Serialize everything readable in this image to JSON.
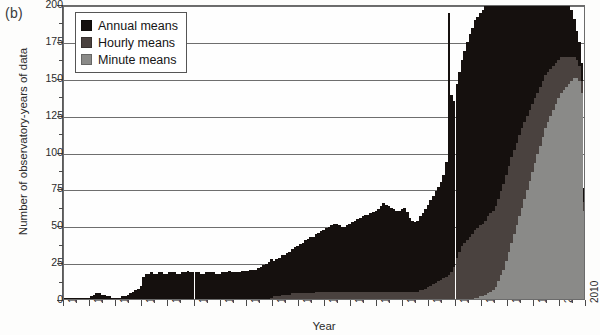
{
  "panel": {
    "label": "(b)"
  },
  "axes": {
    "ylabel": "Number of observatory-years of data",
    "xlabel": "Year",
    "yticks": [
      0,
      25,
      50,
      75,
      100,
      125,
      150,
      175,
      200
    ],
    "xticks": [
      1810,
      1820,
      1830,
      1840,
      1850,
      1860,
      1870,
      1880,
      1890,
      1900,
      1910,
      1920,
      1930,
      1940,
      1950,
      1960,
      1970,
      1980,
      1990,
      2000,
      2010
    ]
  },
  "legend": {
    "items": [
      {
        "label": "Annual means",
        "color": "#15100e"
      },
      {
        "label": "Hourly means",
        "color": "#4a423f"
      },
      {
        "label": "Minute means",
        "color": "#8a8a88"
      }
    ]
  },
  "chart_data": {
    "type": "bar",
    "stacked": true,
    "title": "",
    "subtitle": "",
    "xlabel": "Year",
    "ylabel": "Number of observatory-years of data",
    "xlim": [
      1810,
      2010
    ],
    "ylim": [
      0,
      200
    ],
    "ytick_step": 25,
    "grid": true,
    "legend_position": "top-left-inside",
    "annotations": [
      {
        "text": "(b)",
        "position": "outside-top-left"
      }
    ],
    "x": [
      1810,
      1811,
      1812,
      1813,
      1814,
      1815,
      1816,
      1817,
      1818,
      1819,
      1820,
      1821,
      1822,
      1823,
      1824,
      1825,
      1826,
      1827,
      1828,
      1829,
      1830,
      1831,
      1832,
      1833,
      1834,
      1835,
      1836,
      1837,
      1838,
      1839,
      1840,
      1841,
      1842,
      1843,
      1844,
      1845,
      1846,
      1847,
      1848,
      1849,
      1850,
      1851,
      1852,
      1853,
      1854,
      1855,
      1856,
      1857,
      1858,
      1859,
      1860,
      1861,
      1862,
      1863,
      1864,
      1865,
      1866,
      1867,
      1868,
      1869,
      1870,
      1871,
      1872,
      1873,
      1874,
      1875,
      1876,
      1877,
      1878,
      1879,
      1880,
      1881,
      1882,
      1883,
      1884,
      1885,
      1886,
      1887,
      1888,
      1889,
      1890,
      1891,
      1892,
      1893,
      1894,
      1895,
      1896,
      1897,
      1898,
      1899,
      1900,
      1901,
      1902,
      1903,
      1904,
      1905,
      1906,
      1907,
      1908,
      1909,
      1910,
      1911,
      1912,
      1913,
      1914,
      1915,
      1916,
      1917,
      1918,
      1919,
      1920,
      1921,
      1922,
      1923,
      1924,
      1925,
      1926,
      1927,
      1928,
      1929,
      1930,
      1931,
      1932,
      1933,
      1934,
      1935,
      1936,
      1937,
      1938,
      1939,
      1940,
      1941,
      1942,
      1943,
      1944,
      1945,
      1946,
      1947,
      1948,
      1949,
      1950,
      1951,
      1952,
      1953,
      1954,
      1955,
      1956,
      1957,
      1958,
      1959,
      1960,
      1961,
      1962,
      1963,
      1964,
      1965,
      1966,
      1967,
      1968,
      1969,
      1970,
      1971,
      1972,
      1973,
      1974,
      1975,
      1976,
      1977,
      1978,
      1979,
      1980,
      1981,
      1982,
      1983,
      1984,
      1985,
      1986,
      1987,
      1988,
      1989,
      1990,
      1991,
      1992,
      1993,
      1994,
      1995,
      1996,
      1997,
      1998,
      1999,
      2000,
      2001,
      2002,
      2003,
      2004,
      2005,
      2006,
      2007,
      2008,
      2009
    ],
    "series": [
      {
        "name": "Annual means",
        "color": "#15100e",
        "values": [
          1,
          1,
          1,
          1,
          1,
          1,
          1,
          1,
          1,
          1,
          2,
          3,
          4,
          4,
          3,
          3,
          2,
          2,
          1,
          1,
          1,
          1,
          2,
          2,
          3,
          4,
          5,
          6,
          7,
          9,
          15,
          17,
          17,
          18,
          17,
          17,
          18,
          18,
          17,
          17,
          18,
          18,
          18,
          17,
          17,
          18,
          18,
          19,
          18,
          18,
          18,
          18,
          17,
          17,
          18,
          18,
          18,
          18,
          17,
          17,
          18,
          18,
          18,
          19,
          18,
          18,
          18,
          18,
          19,
          19,
          19,
          20,
          20,
          20,
          21,
          22,
          23,
          24,
          25,
          26,
          24,
          25,
          26,
          27,
          27,
          28,
          29,
          30,
          31,
          32,
          33,
          34,
          36,
          37,
          38,
          38,
          39,
          40,
          41,
          42,
          43,
          44,
          45,
          46,
          46,
          45,
          44,
          44,
          45,
          46,
          47,
          48,
          49,
          50,
          51,
          52,
          52,
          53,
          54,
          55,
          56,
          58,
          60,
          59,
          58,
          57,
          56,
          55,
          55,
          56,
          57,
          54,
          50,
          48,
          47,
          48,
          50,
          52,
          54,
          56,
          58,
          60,
          62,
          64,
          66,
          70,
          78,
          178,
          120,
          112,
          118,
          122,
          126,
          130,
          134,
          138,
          140,
          142,
          143,
          144,
          145,
          146,
          147,
          146,
          145,
          144,
          142,
          140,
          138,
          135,
          132,
          130,
          128,
          126,
          124,
          122,
          120,
          116,
          112,
          108,
          104,
          100,
          96,
          92,
          88,
          84,
          80,
          74,
          68,
          62,
          56,
          50,
          44,
          38,
          32,
          26,
          20,
          16,
          12,
          9
        ]
      },
      {
        "name": "Hourly means",
        "color": "#4a423f",
        "values": [
          0,
          0,
          0,
          0,
          0,
          0,
          0,
          0,
          0,
          0,
          0,
          0,
          0,
          0,
          0,
          0,
          0,
          0,
          0,
          0,
          0,
          0,
          0,
          0,
          0,
          0,
          0,
          0,
          0,
          0,
          0,
          0,
          0,
          0,
          0,
          0,
          0,
          0,
          0,
          0,
          0,
          0,
          0,
          0,
          0,
          0,
          0,
          0,
          0,
          0,
          0,
          0,
          0,
          0,
          0,
          0,
          0,
          0,
          0,
          0,
          0,
          0,
          0,
          0,
          0,
          0,
          0,
          0,
          0,
          0,
          0,
          0,
          0,
          0,
          0,
          0,
          0,
          0,
          0,
          1,
          2,
          2,
          2,
          3,
          3,
          3,
          3,
          4,
          4,
          4,
          4,
          4,
          4,
          4,
          4,
          4,
          5,
          5,
          5,
          5,
          5,
          5,
          5,
          5,
          5,
          5,
          5,
          5,
          5,
          5,
          5,
          5,
          5,
          5,
          5,
          5,
          5,
          5,
          5,
          5,
          5,
          5,
          5,
          5,
          5,
          5,
          5,
          5,
          5,
          5,
          5,
          5,
          5,
          5,
          5,
          5,
          6,
          6,
          7,
          8,
          9,
          10,
          11,
          12,
          13,
          14,
          15,
          16,
          18,
          22,
          28,
          32,
          36,
          38,
          40,
          42,
          44,
          46,
          47,
          48,
          49,
          50,
          52,
          53,
          54,
          55,
          56,
          57,
          58,
          58,
          58,
          58,
          57,
          56,
          55,
          54,
          52,
          50,
          48,
          46,
          44,
          42,
          40,
          38,
          36,
          34,
          32,
          30,
          28,
          26,
          24,
          22,
          20,
          18,
          16,
          14,
          12,
          10,
          8,
          6
        ]
      },
      {
        "name": "Minute means",
        "color": "#8a8a88",
        "values": [
          0,
          0,
          0,
          0,
          0,
          0,
          0,
          0,
          0,
          0,
          0,
          0,
          0,
          0,
          0,
          0,
          0,
          0,
          0,
          0,
          0,
          0,
          0,
          0,
          0,
          0,
          0,
          0,
          0,
          0,
          0,
          0,
          0,
          0,
          0,
          0,
          0,
          0,
          0,
          0,
          0,
          0,
          0,
          0,
          0,
          0,
          0,
          0,
          0,
          0,
          0,
          0,
          0,
          0,
          0,
          0,
          0,
          0,
          0,
          0,
          0,
          0,
          0,
          0,
          0,
          0,
          0,
          0,
          0,
          0,
          0,
          0,
          0,
          0,
          0,
          0,
          0,
          0,
          0,
          0,
          0,
          0,
          0,
          0,
          0,
          0,
          0,
          0,
          0,
          0,
          0,
          0,
          0,
          0,
          0,
          0,
          0,
          0,
          0,
          0,
          0,
          0,
          0,
          0,
          0,
          0,
          0,
          0,
          0,
          0,
          0,
          0,
          0,
          0,
          0,
          0,
          0,
          0,
          0,
          0,
          0,
          0,
          0,
          0,
          0,
          0,
          0,
          0,
          0,
          0,
          0,
          0,
          0,
          0,
          0,
          0,
          0,
          0,
          0,
          0,
          0,
          0,
          0,
          0,
          0,
          0,
          0,
          0,
          0,
          0,
          0,
          0,
          0,
          0,
          0,
          0,
          0,
          1,
          1,
          2,
          2,
          3,
          4,
          5,
          6,
          8,
          12,
          16,
          20,
          26,
          32,
          38,
          44,
          50,
          56,
          62,
          68,
          74,
          80,
          86,
          92,
          98,
          104,
          110,
          116,
          120,
          124,
          128,
          132,
          136,
          140,
          142,
          144,
          146,
          148,
          150,
          150,
          148,
          140,
          60
        ]
      }
    ]
  }
}
